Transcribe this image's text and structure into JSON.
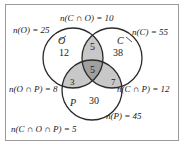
{
  "diagram": {
    "type": "venn-3-set",
    "sets": [
      {
        "id": "O",
        "label": "O"
      },
      {
        "id": "C",
        "label": "C"
      },
      {
        "id": "P",
        "label": "P"
      }
    ],
    "region_counts": {
      "O_only": "12",
      "C_only": "38",
      "P_only": "30",
      "C_and_O_only": "5",
      "O_and_P_only": "3",
      "C_and_P_only": "7",
      "C_and_O_and_P": "5"
    },
    "outer_labels": {
      "top": "n(C ∩ O) = 10",
      "left": "n(O) = 25",
      "right": "n(C) = 55",
      "lower_left": "n(O ∩ P) = 8",
      "lower_right": "n(C ∩ P) = 12",
      "bottom_right": "n(P) = 45",
      "bottom_left": "n(C ∩ O ∩ P) = 5"
    },
    "colors": {
      "stroke": "#2b2b2b",
      "frame": "#9a9a9a",
      "pair_fill": "#c8c8c8",
      "triple_fill": "#a0a0a0",
      "background": "#ffffff",
      "text": "#1a1a1a"
    }
  }
}
